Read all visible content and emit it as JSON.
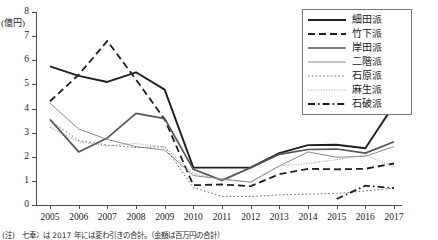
{
  "chart_data": {
    "type": "line",
    "title": "",
    "subtitle": "",
    "xlabel": "",
    "ylabel": "(億円)",
    "unit_label": "(億円)",
    "x": [
      2005,
      2006,
      2007,
      2008,
      2009,
      2010,
      2011,
      2012,
      2013,
      2014,
      2015,
      2016,
      2017
    ],
    "categories": [
      "2005",
      "2006",
      "2007",
      "2008",
      "2009",
      "2010",
      "2011",
      "2012",
      "2013",
      "2014",
      "2015",
      "2016",
      "2017"
    ],
    "xlim": [
      2005,
      2017
    ],
    "ylim": [
      0,
      8
    ],
    "yticks": [
      0,
      1,
      2,
      3,
      4,
      5,
      6,
      7,
      8
    ],
    "ytick_labels": [
      "0",
      "1",
      "2",
      "3",
      "4",
      "5",
      "6",
      "7",
      "8"
    ],
    "grid": false,
    "legend_position": "top-right",
    "series": [
      {
        "name": "細田派",
        "style": "solid",
        "color": "#1f1f1f",
        "width": 1.9,
        "values": [
          5.75,
          5.35,
          5.1,
          5.5,
          4.78,
          1.55,
          1.55,
          1.55,
          2.15,
          2.48,
          2.5,
          2.35,
          4.15
        ]
      },
      {
        "name": "竹下派",
        "style": "dashed",
        "color": "#1f1f1f",
        "width": 1.8,
        "values": [
          4.3,
          5.4,
          6.8,
          5.2,
          3.55,
          0.82,
          0.85,
          0.78,
          1.28,
          1.5,
          1.48,
          1.5,
          1.72
        ]
      },
      {
        "name": "岸田派",
        "style": "solid",
        "color": "#555555",
        "width": 1.7,
        "values": [
          3.55,
          2.2,
          2.78,
          3.8,
          3.58,
          1.48,
          1.02,
          1.55,
          2.1,
          2.3,
          2.32,
          2.15,
          2.62
        ]
      },
      {
        "name": "二階派",
        "style": "solid",
        "color": "#8a8a8a",
        "width": 1.0,
        "values": [
          4.22,
          3.15,
          2.72,
          2.42,
          2.28,
          1.22,
          1.08,
          0.95,
          1.62,
          2.2,
          1.98,
          2.02,
          2.42
        ]
      },
      {
        "name": "石原派",
        "style": "dotted",
        "color": "#6f6f6f",
        "width": 1.0,
        "values": [
          3.5,
          2.68,
          2.48,
          2.38,
          2.42,
          0.72,
          0.36,
          0.35,
          0.42,
          0.45,
          0.48,
          0.58,
          0.7
        ]
      },
      {
        "name": "麻生派",
        "style": "fine-dotted",
        "color": "#9a9a9a",
        "width": 1.1,
        "values": [
          3.22,
          2.62,
          2.45,
          2.55,
          2.4,
          1.3,
          1.05,
          0.95,
          1.62,
          1.72,
          1.88,
          2.08,
          1.58
        ]
      },
      {
        "name": "石破派",
        "style": "dash-dot",
        "color": "#1f1f1f",
        "width": 1.8,
        "values": [
          null,
          null,
          null,
          null,
          null,
          null,
          null,
          null,
          null,
          null,
          0.25,
          0.8,
          0.7
        ]
      }
    ]
  },
  "legend": {
    "items": [
      {
        "label": "細田派",
        "style": "solid",
        "color": "#1f1f1f",
        "width": 1.9
      },
      {
        "label": "竹下派",
        "style": "dashed",
        "color": "#1f1f1f",
        "width": 1.8
      },
      {
        "label": "岸田派",
        "style": "solid",
        "color": "#555555",
        "width": 1.7
      },
      {
        "label": "二階派",
        "style": "solid",
        "color": "#8a8a8a",
        "width": 1.0
      },
      {
        "label": "石原派",
        "style": "dotted",
        "color": "#6f6f6f",
        "width": 1.0
      },
      {
        "label": "麻生派",
        "style": "fine-dotted",
        "color": "#9a9a9a",
        "width": 1.1
      },
      {
        "label": "石破派",
        "style": "dash-dot",
        "color": "#1f1f1f",
        "width": 1.8
      }
    ]
  },
  "footnote": {
    "text": "(注)　七奉冫は 2017 年には変わ引きの合計。（金額は百万円の合計）"
  }
}
